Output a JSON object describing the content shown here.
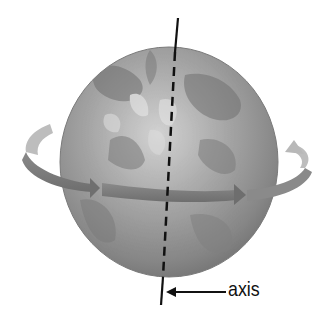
{
  "diagram": {
    "labels": {
      "axis": "axis"
    },
    "elements": {
      "globe": {
        "description": "grayscale Earth globe",
        "fill": "#8e8e8e",
        "highlight": "#c9c9c9"
      },
      "axis_line": {
        "description": "tilted rotation axis, solid outside globe, dashed through globe",
        "color": "#111111"
      },
      "rotation_arrow": {
        "description": "curved band arrow wrapping around globe showing rotation direction (left to right in front)",
        "front_color": "#7a7a7a",
        "back_color": "#b9b9b9"
      },
      "label_pointer": {
        "description": "arrow pointing from label to axis line",
        "color": "#111111"
      }
    },
    "colors": {
      "background": "#ffffff",
      "globe_dark": "#6f6f6f",
      "globe_light": "#d4d4d4",
      "arrow_front": "#7d7d7d",
      "arrow_back": "#bdbdbd",
      "line": "#111111"
    }
  }
}
